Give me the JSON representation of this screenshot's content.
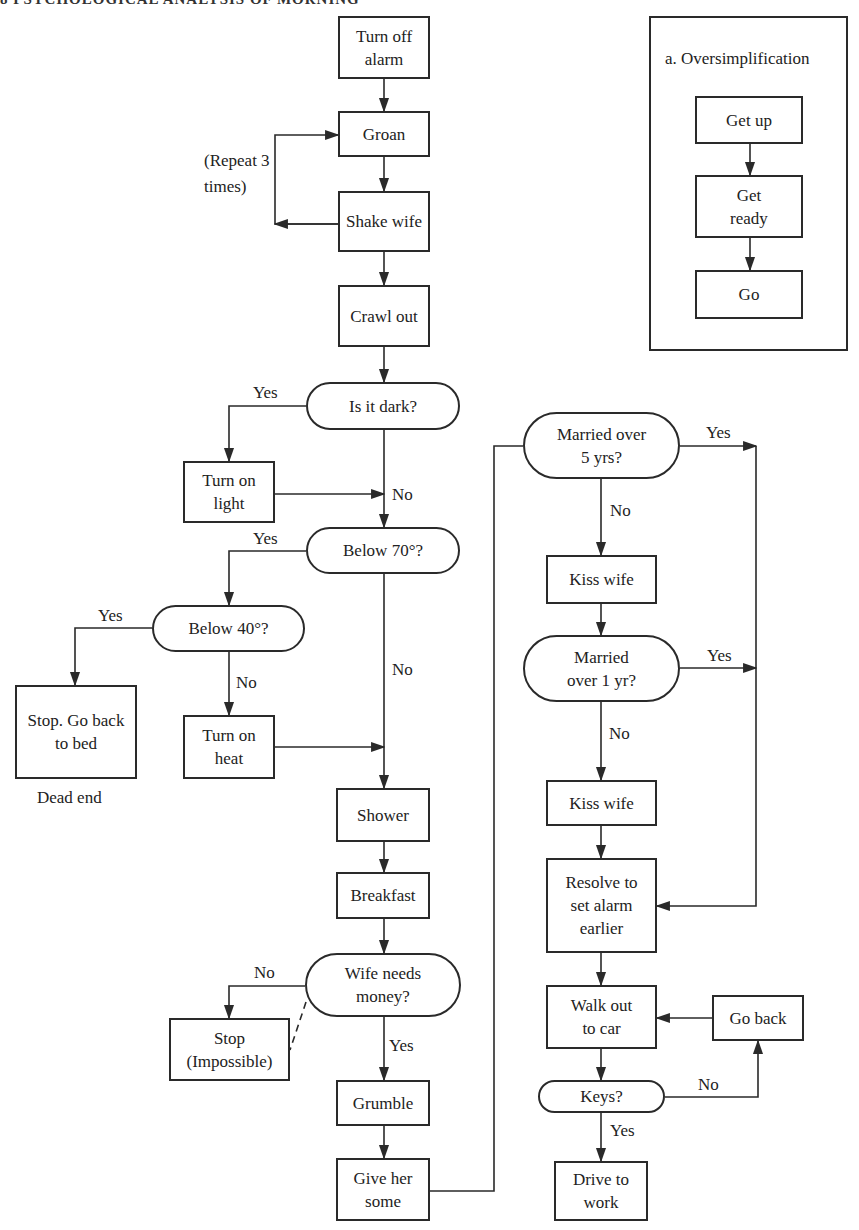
{
  "header": {
    "text": "8   PSYCHOLOGICAL ANALYSIS OF MORNING"
  },
  "oversimplification": {
    "title": "a. Oversimplification",
    "steps": [
      "Get up",
      "Get ready",
      "Go"
    ]
  },
  "nodes": {
    "turn_off_alarm": "Turn off alarm",
    "groan": "Groan",
    "shake_wife": "Shake wife",
    "crawl_out": "Crawl out",
    "is_it_dark": "Is it dark?",
    "turn_on_light": "Turn on light",
    "below_70": "Below 70°?",
    "below_40": "Below 40°?",
    "stop_go_back_to_bed": "Stop. Go back to bed",
    "turn_on_heat": "Turn on heat",
    "shower": "Shower",
    "breakfast": "Breakfast",
    "wife_needs_money": "Wife needs money?",
    "stop_impossible": "Stop (Impossible)",
    "grumble": "Grumble",
    "give_her_some": "Give her some",
    "married_over_5": "Married over 5 yrs?",
    "kiss_wife_1": "Kiss wife",
    "married_over_1": "Married over 1 yr?",
    "kiss_wife_2": "Kiss wife",
    "resolve_alarm": "Resolve to set alarm earlier",
    "walk_out_to_car": "Walk out to car",
    "go_back": "Go back",
    "keys": "Keys?",
    "drive_to_work": "Drive to work"
  },
  "labels": {
    "repeat": "(Repeat 3 times)",
    "dead_end": "Dead end",
    "dark_yes": "Yes",
    "dark_no": "No",
    "b70_yes": "Yes",
    "b70_no": "No",
    "b40_yes": "Yes",
    "b40_no": "No",
    "money_no": "No",
    "money_yes": "Yes",
    "m5_yes": "Yes",
    "m5_no": "No",
    "m1_yes": "Yes",
    "m1_no": "No",
    "keys_no": "No",
    "keys_yes": "Yes"
  }
}
